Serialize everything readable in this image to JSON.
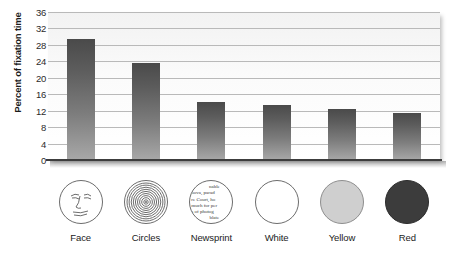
{
  "chart_data": {
    "type": "bar",
    "title": "",
    "xlabel": "",
    "ylabel": "Percent of fixation time",
    "categories": [
      "Face",
      "Circles",
      "Newsprint",
      "White",
      "Yellow",
      "Red"
    ],
    "values": [
      29.5,
      23.5,
      14.0,
      13.5,
      12.5,
      11.5
    ],
    "ylim": [
      0,
      36
    ],
    "yticks": [
      0,
      4,
      8,
      12,
      16,
      20,
      24,
      28,
      32,
      36
    ],
    "ytick_labels": [
      "0",
      "4",
      "8",
      "12",
      "16",
      "20",
      "24",
      "28",
      "32",
      "36"
    ],
    "grid": true,
    "legend": false,
    "bar_color_top": "#4a4a4a",
    "bar_color_bottom": "#a8a8a8",
    "gridline_color": "#b9b9b9",
    "plot_background": "#f7f7f7"
  },
  "icons": [
    {
      "name": "face-icon",
      "kind": "face",
      "fill": "#ffffff",
      "stroke": "#6d6d6d"
    },
    {
      "name": "concentric-circles-icon",
      "kind": "concentric",
      "fill": "#ffffff",
      "stroke": "#6d6d6d"
    },
    {
      "name": "newsprint-icon",
      "kind": "newsprint",
      "fill": "#ffffff",
      "stroke": "#6d6d6d",
      "lines": [
        "nable",
        "nova, parad",
        "re Court, ho",
        "much for per",
        "s of photog",
        "blate"
      ]
    },
    {
      "name": "white-circle-icon",
      "kind": "plain",
      "fill": "#ffffff",
      "stroke": "#6d6d6d"
    },
    {
      "name": "yellow-circle-icon",
      "kind": "plain",
      "fill": "#cfcfcf",
      "stroke": "#8e8e8e"
    },
    {
      "name": "red-circle-icon",
      "kind": "plain",
      "fill": "#3c3c3c",
      "stroke": "#2c2c2c"
    }
  ]
}
